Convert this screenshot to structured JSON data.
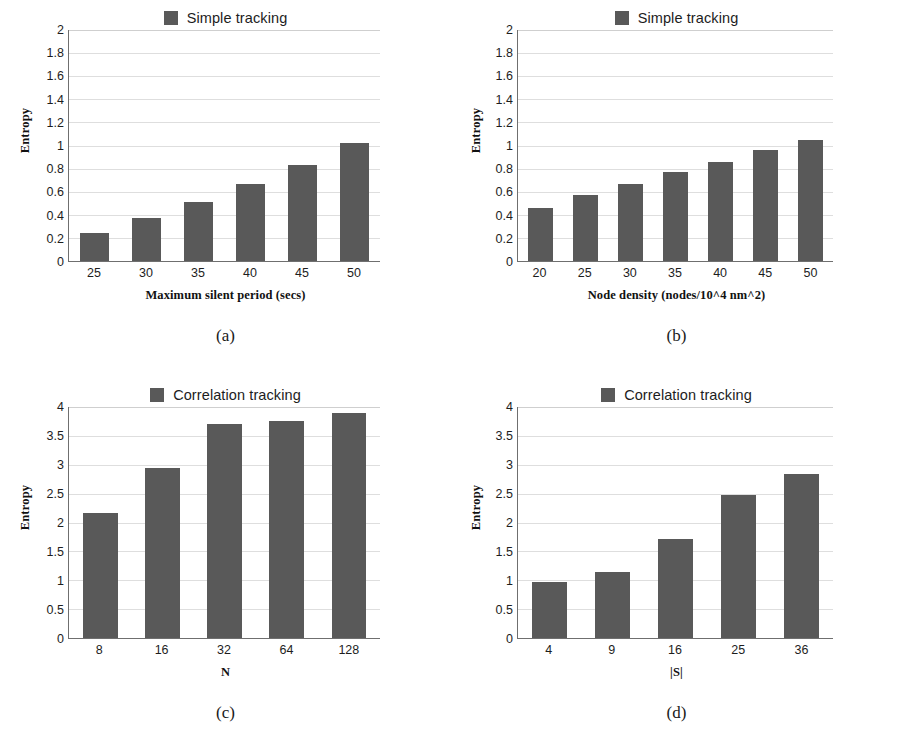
{
  "figure": {
    "background": "#ffffff",
    "bar_color": "#595959",
    "gridline_color": "#dedede",
    "axis_color": "#6f6f6f",
    "width": 902,
    "height": 754
  },
  "panels": [
    {
      "caption": "(a)",
      "legend_label": "Simple tracking",
      "legend_icon": "legend-swatch-icon",
      "ylabel": "Entropy",
      "xlabel": "Maximum silent period (secs)",
      "yticks": [
        "0",
        "0.2",
        "0.4",
        "0.6",
        "0.8",
        "1",
        "1.2",
        "1.4",
        "1.6",
        "1.8",
        "2"
      ],
      "categories": [
        "25",
        "30",
        "35",
        "40",
        "45",
        "50"
      ],
      "values": [
        0.24,
        0.37,
        0.51,
        0.67,
        0.83,
        1.02
      ],
      "ymin": 0,
      "ymax": 2
    },
    {
      "caption": "(b)",
      "legend_label": "Simple tracking",
      "legend_icon": "legend-swatch-icon",
      "ylabel": "Entropy",
      "xlabel": "Node density (nodes/10^4 nm^2)",
      "yticks": [
        "0",
        "0.2",
        "0.4",
        "0.6",
        "0.8",
        "1",
        "1.2",
        "1.4",
        "1.6",
        "1.8",
        "2"
      ],
      "categories": [
        "20",
        "25",
        "30",
        "35",
        "40",
        "45",
        "50"
      ],
      "values": [
        0.46,
        0.57,
        0.67,
        0.77,
        0.86,
        0.96,
        1.05
      ],
      "ymin": 0,
      "ymax": 2
    },
    {
      "caption": "(c)",
      "legend_label": "Correlation tracking",
      "legend_icon": "legend-swatch-icon",
      "ylabel": "Entropy",
      "xlabel": "N",
      "yticks": [
        "0",
        "0.5",
        "1",
        "1.5",
        "2",
        "2.5",
        "3",
        "3.5",
        "4"
      ],
      "categories": [
        "8",
        "16",
        "32",
        "64",
        "128"
      ],
      "values": [
        2.17,
        2.95,
        3.71,
        3.76,
        3.89
      ],
      "ymin": 0,
      "ymax": 4
    },
    {
      "caption": "(d)",
      "legend_label": "Correlation tracking",
      "legend_icon": "legend-swatch-icon",
      "ylabel": "Entropy",
      "xlabel": "|S|",
      "yticks": [
        "0",
        "0.5",
        "1",
        "1.5",
        "2",
        "2.5",
        "3",
        "3.5",
        "4"
      ],
      "categories": [
        "4",
        "9",
        "16",
        "25",
        "36"
      ],
      "values": [
        0.97,
        1.15,
        1.71,
        2.48,
        2.84
      ],
      "ymin": 0,
      "ymax": 4
    }
  ],
  "chart_data": [
    {
      "type": "bar",
      "title": "Simple tracking",
      "subfigure": "(a)",
      "categories": [
        "25",
        "30",
        "35",
        "40",
        "45",
        "50"
      ],
      "values": [
        0.24,
        0.37,
        0.51,
        0.67,
        0.83,
        1.02
      ],
      "xlabel": "Maximum silent period (secs)",
      "ylabel": "Entropy",
      "ylim": [
        0,
        2
      ],
      "ytick_step": 0.2,
      "grid": true,
      "legend": [
        "Simple tracking"
      ],
      "legend_position": "top-center"
    },
    {
      "type": "bar",
      "title": "Simple tracking",
      "subfigure": "(b)",
      "categories": [
        "20",
        "25",
        "30",
        "35",
        "40",
        "45",
        "50"
      ],
      "values": [
        0.46,
        0.57,
        0.67,
        0.77,
        0.86,
        0.96,
        1.05
      ],
      "xlabel": "Node density (nodes/10^4 nm^2)",
      "ylabel": "Entropy",
      "ylim": [
        0,
        2
      ],
      "ytick_step": 0.2,
      "grid": true,
      "legend": [
        "Simple tracking"
      ],
      "legend_position": "top-center"
    },
    {
      "type": "bar",
      "title": "Correlation tracking",
      "subfigure": "(c)",
      "categories": [
        "8",
        "16",
        "32",
        "64",
        "128"
      ],
      "values": [
        2.17,
        2.95,
        3.71,
        3.76,
        3.89
      ],
      "xlabel": "N",
      "ylabel": "Entropy",
      "ylim": [
        0,
        4
      ],
      "ytick_step": 0.5,
      "grid": true,
      "legend": [
        "Correlation tracking"
      ],
      "legend_position": "top-center"
    },
    {
      "type": "bar",
      "title": "Correlation tracking",
      "subfigure": "(d)",
      "categories": [
        "4",
        "9",
        "16",
        "25",
        "36"
      ],
      "values": [
        0.97,
        1.15,
        1.71,
        2.48,
        2.84
      ],
      "xlabel": "|S|",
      "ylabel": "Entropy",
      "ylim": [
        0,
        4
      ],
      "ytick_step": 0.5,
      "grid": true,
      "legend": [
        "Correlation tracking"
      ],
      "legend_position": "top-center"
    }
  ]
}
